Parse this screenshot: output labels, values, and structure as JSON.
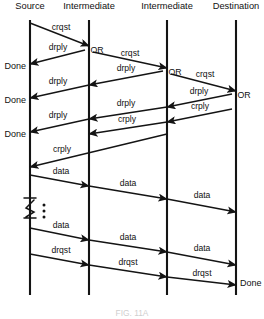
{
  "figure": {
    "type": "sequence-diagram",
    "title": "",
    "caption": "FIG. 11A",
    "caption_visible": "partially cropped / faint"
  },
  "columns": [
    {
      "id": "source",
      "label": "Source",
      "x": 30
    },
    {
      "id": "intermediate1",
      "label": "Intermediate",
      "x": 89
    },
    {
      "id": "intermediate2",
      "label": "Intermediate",
      "x": 167
    },
    {
      "id": "destination",
      "label": "Destination",
      "x": 236
    }
  ],
  "or_nodes": [
    {
      "label": "OR",
      "x": 89,
      "y": 50
    },
    {
      "label": "OR",
      "x": 167,
      "y": 72
    },
    {
      "label": "OR",
      "x": 236,
      "y": 95
    }
  ],
  "terminal_labels": {
    "done_left": [
      {
        "label": "Done",
        "y": 66
      },
      {
        "label": "Done",
        "y": 100
      },
      {
        "label": "Done",
        "y": 134
      }
    ],
    "done_right": [
      {
        "label": "Done",
        "y": 283
      }
    ]
  },
  "messages": [
    {
      "label": "crqst",
      "from": "source",
      "to": "intermediate1",
      "direction": "right",
      "x1": 30,
      "y1": 23,
      "x2": 89,
      "y2": 46,
      "lx": 61,
      "ly": 30
    },
    {
      "label": "crqst",
      "from": "intermediate1",
      "to": "intermediate2",
      "direction": "right",
      "x1": 93,
      "y1": 52,
      "x2": 167,
      "y2": 68,
      "lx": 130,
      "ly": 56
    },
    {
      "label": "crqst",
      "from": "intermediate2",
      "to": "destination",
      "direction": "right",
      "x1": 171,
      "y1": 74,
      "x2": 236,
      "y2": 91,
      "lx": 205,
      "ly": 77
    },
    {
      "label": "drply",
      "from": "intermediate1",
      "to": "source",
      "direction": "left",
      "x1": 85,
      "y1": 50,
      "x2": 30,
      "y2": 64,
      "lx": 58,
      "ly": 50
    },
    {
      "label": "drply",
      "from": "intermediate2",
      "to": "intermediate1",
      "direction": "left",
      "x1": 163,
      "y1": 71,
      "x2": 89,
      "y2": 85,
      "lx": 126,
      "ly": 71
    },
    {
      "label": "drply",
      "from": "intermediate1",
      "to": "source",
      "direction": "left",
      "x1": 89,
      "y1": 85,
      "x2": 30,
      "y2": 98,
      "lx": 58,
      "ly": 84
    },
    {
      "label": "drply",
      "from": "destination",
      "to": "intermediate2",
      "direction": "left",
      "x1": 232,
      "y1": 94,
      "x2": 167,
      "y2": 107,
      "lx": 199,
      "ly": 94
    },
    {
      "label": "drply",
      "from": "intermediate2",
      "to": "intermediate1",
      "direction": "left",
      "x1": 167,
      "y1": 107,
      "x2": 89,
      "y2": 119,
      "lx": 126,
      "ly": 106
    },
    {
      "label": "drply",
      "from": "intermediate1",
      "to": "source",
      "direction": "left",
      "x1": 89,
      "y1": 119,
      "x2": 30,
      "y2": 132,
      "lx": 58,
      "ly": 118
    },
    {
      "label": "crply",
      "from": "destination",
      "to": "intermediate2",
      "direction": "left",
      "x1": 232,
      "y1": 109,
      "x2": 167,
      "y2": 122,
      "lx": 200,
      "ly": 109
    },
    {
      "label": "crply",
      "from": "intermediate2",
      "to": "intermediate1",
      "direction": "left",
      "x1": 167,
      "y1": 122,
      "x2": 89,
      "y2": 134,
      "lx": 127,
      "ly": 122
    },
    {
      "label": "crply",
      "from": "intermediate1",
      "to": "source",
      "direction": "left",
      "x1": 167,
      "y1": 134,
      "x2": 30,
      "y2": 167,
      "lx": 62,
      "ly": 152
    },
    {
      "label": "data",
      "from": "source",
      "to": "intermediate1",
      "direction": "right",
      "x1": 30,
      "y1": 175,
      "x2": 89,
      "y2": 186,
      "lx": 61,
      "ly": 174
    },
    {
      "label": "data",
      "from": "intermediate1",
      "to": "intermediate2",
      "direction": "right",
      "x1": 89,
      "y1": 186,
      "x2": 167,
      "y2": 199,
      "lx": 128,
      "ly": 186
    },
    {
      "label": "data",
      "from": "intermediate2",
      "to": "destination",
      "direction": "right",
      "x1": 167,
      "y1": 199,
      "x2": 236,
      "y2": 212,
      "lx": 202,
      "ly": 198
    },
    {
      "label": "data",
      "from": "source",
      "to": "intermediate1",
      "direction": "right",
      "x1": 30,
      "y1": 228,
      "x2": 89,
      "y2": 240,
      "lx": 61,
      "ly": 228
    },
    {
      "label": "data",
      "from": "intermediate1",
      "to": "intermediate2",
      "direction": "right",
      "x1": 89,
      "y1": 240,
      "x2": 167,
      "y2": 252,
      "lx": 128,
      "ly": 240
    },
    {
      "label": "data",
      "from": "intermediate2",
      "to": "destination",
      "direction": "right",
      "x1": 167,
      "y1": 252,
      "x2": 236,
      "y2": 265,
      "lx": 202,
      "ly": 251
    },
    {
      "label": "drqst",
      "from": "source",
      "to": "intermediate1",
      "direction": "right",
      "x1": 30,
      "y1": 254,
      "x2": 89,
      "y2": 265,
      "lx": 61,
      "ly": 253
    },
    {
      "label": "drqst",
      "from": "intermediate1",
      "to": "intermediate2",
      "direction": "right",
      "x1": 89,
      "y1": 265,
      "x2": 167,
      "y2": 277,
      "lx": 128,
      "ly": 265
    },
    {
      "label": "drqst",
      "from": "intermediate2",
      "to": "destination",
      "direction": "right",
      "x1": 167,
      "y1": 277,
      "x2": 236,
      "y2": 285,
      "lx": 202,
      "ly": 276
    }
  ],
  "break_symbol": {
    "present": true,
    "x": 30,
    "y": 210,
    "dots": [
      205,
      211,
      217
    ],
    "dots_x": 44
  }
}
